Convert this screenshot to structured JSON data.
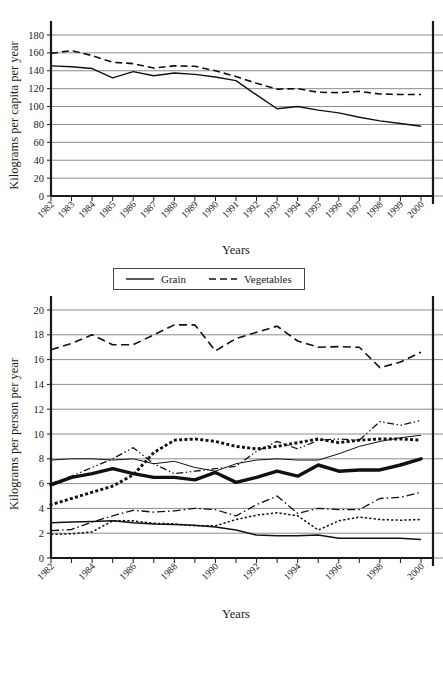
{
  "chart_data": [
    {
      "id": "grain-vegetables",
      "type": "line",
      "title": "",
      "xlabel": "Years",
      "ylabel": "Kilograms per capita per year",
      "ylim": [
        0,
        180
      ],
      "yticks": [
        0,
        20,
        40,
        60,
        80,
        100,
        120,
        140,
        160,
        180
      ],
      "grid": true,
      "legend_position": "below",
      "x": [
        "1982",
        "1983",
        "1984",
        "1985",
        "1986",
        "1987",
        "1988",
        "1989",
        "1990",
        "1991",
        "1992",
        "1993",
        "1994",
        "1995",
        "1996",
        "1997",
        "1998",
        "1999",
        "2000"
      ],
      "series": [
        {
          "name": "Grain",
          "style": "solid",
          "values": [
            145.5,
            144.5,
            142.5,
            132.0,
            139.0,
            134.5,
            137.5,
            136.0,
            133.0,
            129.0,
            113.0,
            97.5,
            100.0,
            96.0,
            93.0,
            88.0,
            84.0,
            81.0,
            78.0
          ]
        },
        {
          "name": "Vegetables",
          "style": "dashed",
          "values": [
            159.5,
            162.5,
            157.0,
            149.5,
            148.0,
            143.0,
            145.5,
            145.0,
            140.0,
            133.5,
            126.0,
            119.5,
            120.0,
            116.0,
            115.5,
            117.0,
            114.0,
            113.5,
            113.5
          ]
        }
      ]
    },
    {
      "id": "food-consumption",
      "type": "line",
      "title": "",
      "xlabel": "Years",
      "ylabel": "Kilograms per person per year",
      "ylim": [
        0,
        20
      ],
      "yticks": [
        0,
        2,
        4,
        6,
        8,
        10,
        12,
        14,
        16,
        18,
        20
      ],
      "xticks": [
        "1982",
        "1984",
        "1986",
        "1988",
        "1990",
        "1992",
        "1994",
        "1996",
        "1998",
        "2000"
      ],
      "grid": true,
      "legend_position": "below",
      "x": [
        "1982",
        "1983",
        "1984",
        "1985",
        "1986",
        "1987",
        "1988",
        "1989",
        "1990",
        "1991",
        "1992",
        "1993",
        "1994",
        "1995",
        "1996",
        "1997",
        "1998",
        "1999",
        "2000"
      ],
      "series": [
        {
          "name": "Oil",
          "style": "thick-solid",
          "values": [
            5.9,
            6.5,
            6.8,
            7.2,
            6.8,
            6.5,
            6.5,
            6.3,
            6.9,
            6.1,
            6.5,
            7.0,
            6.6,
            7.5,
            7.0,
            7.1,
            7.1,
            7.5,
            8.0
          ]
        },
        {
          "name": "Seafood",
          "style": "thin-gray-solid",
          "values": [
            7.9,
            8.0,
            8.0,
            7.9,
            8.0,
            7.6,
            7.8,
            7.3,
            7.0,
            7.6,
            7.9,
            8.0,
            7.9,
            7.9,
            8.4,
            9.0,
            9.4,
            9.7,
            9.9
          ]
        },
        {
          "name": "Liquid",
          "style": "square-dotted",
          "values": [
            4.3,
            4.8,
            5.3,
            5.8,
            6.7,
            8.5,
            9.5,
            9.6,
            9.4,
            9.0,
            8.8,
            9.0,
            9.3,
            9.6,
            9.3,
            9.5,
            9.6,
            9.6,
            9.5
          ]
        },
        {
          "name": "Sugar",
          "style": "medium-solid",
          "values": [
            2.85,
            2.9,
            2.95,
            3.0,
            2.85,
            2.75,
            2.7,
            2.65,
            2.5,
            2.25,
            1.85,
            1.8,
            1.8,
            1.85,
            1.6,
            1.6,
            1.6,
            1.6,
            1.5
          ]
        },
        {
          "name": "Eggs",
          "style": "dash-dot-dot",
          "values": [
            6.0,
            6.6,
            7.3,
            8.0,
            8.9,
            7.6,
            6.8,
            7.0,
            7.2,
            7.4,
            8.6,
            9.4,
            8.8,
            9.5,
            9.6,
            9.5,
            11.0,
            10.7,
            11.1
          ]
        },
        {
          "name": "Poultry",
          "style": "dash-dot",
          "values": [
            2.2,
            2.3,
            2.9,
            3.4,
            3.85,
            3.7,
            3.8,
            4.0,
            3.9,
            3.4,
            4.3,
            5.0,
            3.6,
            4.0,
            3.9,
            3.9,
            4.8,
            4.9,
            5.3
          ]
        },
        {
          "name": "Pork",
          "style": "long-dashed",
          "values": [
            16.8,
            17.3,
            18.0,
            17.2,
            17.2,
            18.0,
            18.8,
            18.8,
            16.7,
            17.7,
            18.2,
            18.7,
            17.5,
            17.0,
            17.05,
            17.0,
            15.35,
            15.8,
            16.6
          ]
        },
        {
          "name": "Beef & Mutton",
          "style": "fine-dotted",
          "values": [
            1.9,
            1.95,
            2.1,
            3.0,
            3.0,
            2.8,
            2.75,
            2.6,
            2.6,
            3.1,
            3.45,
            3.65,
            3.4,
            2.25,
            3.0,
            3.3,
            3.1,
            3.05,
            3.1
          ]
        }
      ]
    }
  ],
  "chart1": {
    "ylabel": "Kilograms per capita per year",
    "xtitle": "Years",
    "legend": [
      {
        "label": "Grain",
        "style": "solid"
      },
      {
        "label": "Vegetables",
        "style": "dashed"
      }
    ]
  },
  "chart2": {
    "ylabel": "Kilograms per person per year",
    "xtitle": "Years",
    "legend": [
      {
        "label": "Oil",
        "style": "thick-solid"
      },
      {
        "label": "Seafood",
        "style": "thin-gray-solid"
      },
      {
        "label": "Liquid",
        "style": "square-dotted"
      },
      {
        "label": "Sugar",
        "style": "medium-solid"
      },
      {
        "label": "Eggs",
        "style": "dash-dot-dot"
      },
      {
        "label": "Poultry",
        "style": "dash-dot"
      },
      {
        "label": "Pork",
        "style": "long-dashed"
      },
      {
        "label": "Beef & Mutton",
        "style": "fine-dotted"
      }
    ]
  }
}
